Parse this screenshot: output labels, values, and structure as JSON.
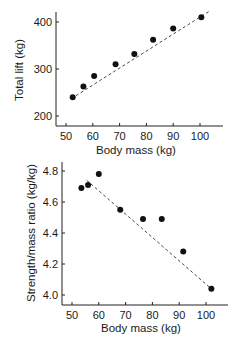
{
  "chart_data": [
    {
      "type": "scatter",
      "title": "",
      "xlabel": "Body mass (kg)",
      "ylabel": "Total lift (kg)",
      "xlim": [
        45,
        108
      ],
      "ylim": [
        175,
        425
      ],
      "x_ticks": [
        50,
        60,
        70,
        80,
        90,
        100
      ],
      "y_ticks": [
        200,
        300,
        400
      ],
      "grid": false,
      "legend": null,
      "trendline": {
        "style": "dashed",
        "from": [
          52,
          237
        ],
        "to": [
          103.5,
          423
        ]
      },
      "series": [
        {
          "name": "lifters",
          "x": [
            52.5,
            56.5,
            60.5,
            68.5,
            75.5,
            82.5,
            90,
            100.5
          ],
          "y": [
            240,
            263,
            285,
            310,
            332,
            362,
            386,
            410
          ]
        }
      ]
    },
    {
      "type": "scatter",
      "title": "",
      "xlabel": "Body mass (kg)",
      "ylabel": "Strength/mass ratio (kg/kg)",
      "xlim": [
        46,
        106
      ],
      "ylim": [
        3.94,
        4.85
      ],
      "x_ticks": [
        50,
        60,
        70,
        80,
        90,
        100
      ],
      "y_ticks": [
        "4.0",
        "4.2",
        "4.4",
        "4.6",
        "4.8"
      ],
      "grid": false,
      "legend": null,
      "trendline": {
        "style": "dashed",
        "from": [
          55.5,
          4.74
        ],
        "to": [
          102,
          4.04
        ]
      },
      "series": [
        {
          "name": "lifters",
          "x": [
            53.5,
            56,
            60,
            68,
            76.5,
            83.5,
            91.5,
            102
          ],
          "y": [
            4.69,
            4.71,
            4.78,
            4.55,
            4.49,
            4.49,
            4.28,
            4.04
          ]
        }
      ]
    }
  ]
}
